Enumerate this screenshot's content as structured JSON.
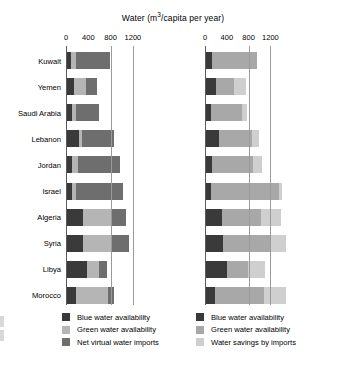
{
  "chart_data": {
    "type": "bar",
    "orientation": "horizontal",
    "stacked": true,
    "xlabel": "",
    "ylabel": "",
    "xlim": [
      0,
      1520
    ],
    "ticks": [
      0,
      400,
      800,
      1200
    ],
    "tick_labels": [
      "0",
      "400",
      "800",
      "1200"
    ],
    "grid": "vertical gridlines at 800 and 1200",
    "legend_position": "below each panel",
    "categories": [
      "Kuwait",
      "Yemen",
      "Saudi Arabia",
      "Lebanon",
      "Jordan",
      "Israel",
      "Algeria",
      "Syria",
      "Libya",
      "Morocco"
    ],
    "panels": [
      {
        "name": "left",
        "series": [
          {
            "name": "Blue water availability",
            "color": "#3a3a3a",
            "values": [
              90,
              150,
              105,
              240,
              105,
              100,
              300,
              310,
              385,
              175
            ]
          },
          {
            "name": "Green water availability",
            "color": "#b5b5b5",
            "values": [
              90,
              215,
              70,
              55,
              115,
              75,
              520,
              520,
              215,
              580
            ]
          },
          {
            "name": "Net virtual water imports",
            "color": "#6e6e6e",
            "values": [
              605,
              195,
              415,
              560,
              740,
              840,
              250,
              305,
              140,
              105
            ]
          }
        ],
        "totals": [
          785,
          560,
          590,
          855,
          960,
          1015,
          1070,
          1135,
          740,
          860
        ]
      },
      {
        "name": "right",
        "series": [
          {
            "name": "Blue water availability",
            "color": "#3a3a3a",
            "values": [
              120,
              200,
              115,
              255,
              120,
              115,
              320,
              330,
              400,
              185
            ]
          },
          {
            "name": "Green water availability",
            "color": "#a8a8a8",
            "values": [
              840,
              330,
              560,
              600,
              770,
              1240,
              700,
              880,
              380,
              900
            ]
          },
          {
            "name": "Water savings by imports",
            "color": "#cfcfcf",
            "values": [
              0,
              215,
              95,
              135,
              155,
              60,
              380,
              285,
              315,
              400
            ]
          }
        ],
        "totals": [
          960,
          745,
          770,
          990,
          1045,
          1415,
          1400,
          1495,
          1095,
          1485
        ]
      }
    ]
  },
  "legends": {
    "left": [
      {
        "label": "Blue water availability",
        "color": "#3a3a3a"
      },
      {
        "label": "Green water availability",
        "color": "#b5b5b5"
      },
      {
        "label": "Net virtual water imports",
        "color": "#6e6e6e"
      }
    ],
    "right": [
      {
        "label": "Blue water availability",
        "color": "#3a3a3a"
      },
      {
        "label": "Green water availability",
        "color": "#a8a8a8"
      },
      {
        "label": "Water savings by imports",
        "color": "#cfcfcf"
      }
    ]
  }
}
